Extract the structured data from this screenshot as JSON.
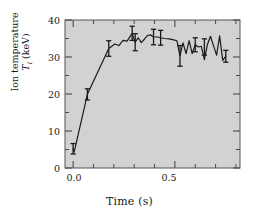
{
  "chart_data": {
    "type": "line",
    "title": "",
    "subtitle": "",
    "xlabel": "Time (s)",
    "ylabel": "Ion temperature T_i (keV)",
    "ylabel_line1": "Ion temperature",
    "ylabel_line2_symbol": "T",
    "ylabel_line2_subscript": "i",
    "ylabel_line2_unit": " (keV)",
    "xlim": [
      -0.04,
      0.82
    ],
    "ylim": [
      0,
      40
    ],
    "grid": false,
    "legend": null,
    "plot_background_color": "#d2d2d2",
    "figure_background_color": "#ffffff",
    "line_color": "#1a1a1a",
    "errorbar_color": "#1a1a1a",
    "axis_color": "#4a4a4a",
    "xticks_major": [
      0.0,
      0.5
    ],
    "xtick_labels": [
      "0.0",
      "0.5"
    ],
    "xticks_minor": [
      0.0,
      0.1,
      0.2,
      0.3,
      0.4,
      0.5,
      0.6,
      0.7,
      0.8
    ],
    "yticks_major": [
      0,
      10,
      20,
      30,
      40
    ],
    "ytick_labels": [
      "0",
      "10",
      "20",
      "30",
      "40"
    ],
    "yticks_minor": [
      5,
      15,
      25,
      35
    ],
    "x": [
      0.0,
      0.005,
      0.07,
      0.175,
      0.205,
      0.225,
      0.245,
      0.265,
      0.29,
      0.305,
      0.32,
      0.335,
      0.35,
      0.365,
      0.38,
      0.395,
      0.415,
      0.43,
      0.45,
      0.47,
      0.49,
      0.51,
      0.525,
      0.54,
      0.555,
      0.57,
      0.585,
      0.6,
      0.615,
      0.63,
      0.645,
      0.66,
      0.675,
      0.69,
      0.705,
      0.72,
      0.735,
      0.75
    ],
    "values": [
      5.2,
      4.3,
      19.9,
      32.3,
      33.5,
      33.1,
      34.5,
      34.3,
      36.4,
      34.0,
      35.2,
      33.9,
      34.8,
      35.8,
      36.0,
      35.4,
      35.4,
      35.2,
      35.0,
      34.9,
      34.7,
      34.4,
      30.3,
      33.8,
      30.9,
      34.4,
      30.9,
      33.3,
      32.7,
      32.9,
      29.3,
      33.4,
      35.6,
      33.0,
      30.5,
      35.7,
      29.1,
      30.2
    ],
    "errorbar_points": [
      {
        "x": 0.0,
        "y": 5.2,
        "err": 1.4
      },
      {
        "x": 0.07,
        "y": 19.9,
        "err": 1.5
      },
      {
        "x": 0.175,
        "y": 32.3,
        "err": 2.1
      },
      {
        "x": 0.29,
        "y": 36.4,
        "err": 1.9
      },
      {
        "x": 0.305,
        "y": 34.0,
        "err": 2.3
      },
      {
        "x": 0.395,
        "y": 35.4,
        "err": 2.1
      },
      {
        "x": 0.43,
        "y": 35.2,
        "err": 2.0
      },
      {
        "x": 0.525,
        "y": 30.3,
        "err": 2.8
      },
      {
        "x": 0.6,
        "y": 33.3,
        "err": 1.9
      },
      {
        "x": 0.645,
        "y": 32.7,
        "err": 2.2
      },
      {
        "x": 0.75,
        "y": 30.2,
        "err": 1.6
      }
    ]
  }
}
